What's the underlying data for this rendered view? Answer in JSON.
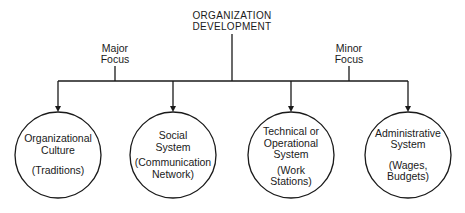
{
  "diagram": {
    "root": {
      "line1": "ORGANIZATION",
      "line2": "DEVELOPMENT"
    },
    "focus_labels": [
      {
        "line1": "Major",
        "line2": "Focus"
      },
      {
        "line1": "Minor",
        "line2": "Focus"
      }
    ],
    "nodes": [
      {
        "title1": "Organizational",
        "title2": "Culture",
        "title3": "",
        "sub1": "(Traditions)",
        "sub2": ""
      },
      {
        "title1": "Social",
        "title2": "System",
        "title3": "",
        "sub1": "(Communication",
        "sub2": "Network)"
      },
      {
        "title1": "Technical or",
        "title2": "Operational",
        "title3": "System",
        "sub1": "(Work",
        "sub2": "Stations)"
      },
      {
        "title1": "Administrative",
        "title2": "System",
        "title3": "",
        "sub1": "(Wages,",
        "sub2": "Budgets)"
      }
    ],
    "colors": {
      "line": "#1a1a1a",
      "background": "#ffffff"
    }
  }
}
